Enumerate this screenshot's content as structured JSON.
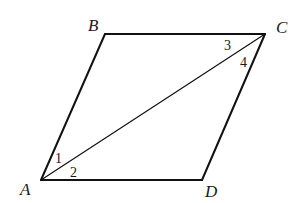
{
  "figure": {
    "type": "parallelogram",
    "vertices": [
      {
        "name": "A",
        "x": 41,
        "y": 180,
        "label_x": 20,
        "label_y": 195
      },
      {
        "name": "B",
        "x": 105,
        "y": 34,
        "label_x": 88,
        "label_y": 31
      },
      {
        "name": "C",
        "x": 265,
        "y": 34,
        "label_x": 276,
        "label_y": 33
      },
      {
        "name": "D",
        "x": 202,
        "y": 180,
        "label_x": 205,
        "label_y": 197
      }
    ],
    "sides": [
      "AB",
      "BC",
      "CD",
      "DA"
    ],
    "diagonal": "AC",
    "angles": [
      {
        "label": "1",
        "x": 55,
        "y": 163
      },
      {
        "label": "2",
        "x": 70,
        "y": 177
      },
      {
        "label": "3",
        "x": 224,
        "y": 50
      },
      {
        "label": "4",
        "x": 240,
        "y": 67
      }
    ],
    "colors": {
      "stroke": "#111111",
      "text": "#1a1a1a",
      "background": "#ffffff"
    }
  }
}
